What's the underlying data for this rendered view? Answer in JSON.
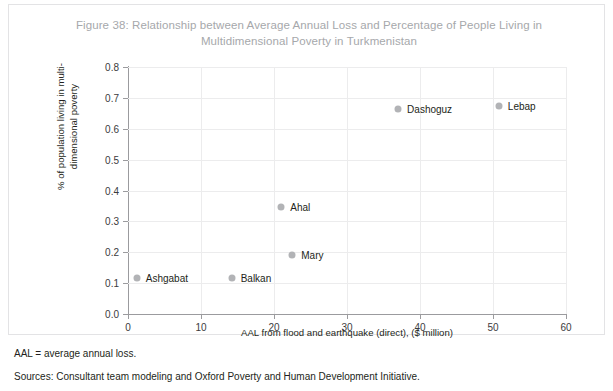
{
  "figure": {
    "title": "Figure 38: Relationship between Average Annual Loss and Percentage of People Living in Multidimensional Poverty in Turkmenistan",
    "title_line_1": "Figure 38: Relationship between Average Annual Loss and Percentage of People",
    "title_line_2": "Living in Multidimensional Poverty in Turkmenistan"
  },
  "footnotes": {
    "abbreviation": "AAL = average annual loss.",
    "sources": "Sources: Consultant team modeling and Oxford Poverty and Human Development Initiative."
  },
  "ylabel_line_1": "% of population living in multi-",
  "ylabel_line_2": "dimensional poverty",
  "colors": {
    "marker": "#b2b3b6",
    "axis": "#9b9b9e",
    "grid": "#ececed",
    "title": "#a6a8ab",
    "text": "#231f20",
    "frame": "#e3e3e5"
  },
  "chart_data": {
    "type": "scatter",
    "title": "Figure 38: Relationship between Average Annual Loss and Percentage of People Living in Multidimensional Poverty in Turkmenistan",
    "xlabel": "AAL from flood and earthquake (direct), ($ million)",
    "ylabel": "% of population living in multi-dimensional poverty",
    "xlim": [
      0,
      60
    ],
    "ylim": [
      0.0,
      0.8
    ],
    "xticks": [
      0,
      10,
      20,
      30,
      40,
      50,
      60
    ],
    "yticks": [
      "0.0",
      "0.1",
      "0.2",
      "0.3",
      "0.4",
      "0.5",
      "0.6",
      "0.7",
      "0.8"
    ],
    "grid": "horizontal-and-vertical",
    "legend": "none",
    "points": [
      {
        "name": "Ashgabat",
        "x": 1.2,
        "y": 0.115,
        "label_side": "right"
      },
      {
        "name": "Balkan",
        "x": 14.2,
        "y": 0.115,
        "label_side": "right"
      },
      {
        "name": "Ahal",
        "x": 21.0,
        "y": 0.345,
        "label_side": "right"
      },
      {
        "name": "Mary",
        "x": 22.5,
        "y": 0.19,
        "label_side": "right"
      },
      {
        "name": "Dashoguz",
        "x": 37.0,
        "y": 0.665,
        "label_side": "right"
      },
      {
        "name": "Lebap",
        "x": 50.8,
        "y": 0.675,
        "label_side": "right"
      }
    ]
  }
}
